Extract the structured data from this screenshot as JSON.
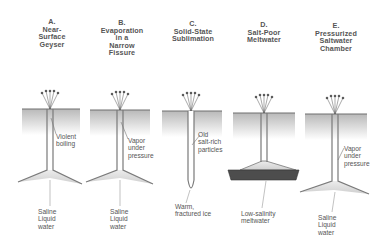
{
  "panels": [
    {
      "id": "A",
      "letter": "A.",
      "title_lines": [
        "Near-",
        "Surface",
        "Geyser"
      ],
      "annotations": [
        {
          "lines": [
            "Violent",
            "boiling"
          ]
        },
        {
          "lines": [
            "Saline",
            "Liquid",
            "water"
          ]
        }
      ]
    },
    {
      "id": "B",
      "letter": "B.",
      "title_lines": [
        "Evaporation",
        "in a",
        "Narrow",
        "Fissure"
      ],
      "annotations": [
        {
          "lines": [
            "Vapor",
            "under",
            "pressure"
          ]
        },
        {
          "lines": [
            "Saline",
            "Liquid",
            "water"
          ]
        }
      ]
    },
    {
      "id": "C",
      "letter": "C.",
      "title_lines": [
        "Solid-State",
        "Sublimation"
      ],
      "annotations": [
        {
          "lines": [
            "Old",
            "salt-rich",
            "particles"
          ]
        },
        {
          "lines": [
            "Warm,",
            "fractured ice"
          ]
        }
      ]
    },
    {
      "id": "D",
      "letter": "D.",
      "title_lines": [
        "Salt-Poor",
        "Meltwater"
      ],
      "annotations": [
        {
          "lines": [
            "Low-salinity",
            "meltwater"
          ]
        }
      ]
    },
    {
      "id": "E",
      "letter": "E.",
      "title_lines": [
        "Pressurized",
        "Saltwater",
        "Chamber"
      ],
      "annotations": [
        {
          "lines": [
            "Vapor",
            "under",
            "pressure"
          ]
        },
        {
          "lines": [
            "Saline",
            "Liquid",
            "water"
          ]
        }
      ]
    }
  ],
  "colors": {
    "ice_gradient_top": "#bdbdbd",
    "ice_gradient_bottom": "#ffffff",
    "surface_line": "#6e6e6e",
    "channel": "#8a8a8a",
    "reservoir_light": "#d9d9d9",
    "reservoir_dark": "#4a4a4a",
    "plume": "#444444"
  }
}
